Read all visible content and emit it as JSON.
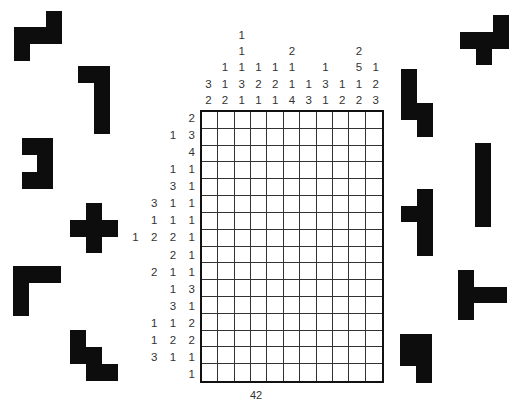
{
  "puzzle": {
    "type": "nonogram",
    "columns": 11,
    "rows": 16,
    "column_clues": [
      [
        3,
        2
      ],
      [
        1,
        1,
        2
      ],
      [
        1,
        1,
        1,
        3,
        1
      ],
      [
        1,
        2,
        1
      ],
      [
        1,
        2,
        1
      ],
      [
        2,
        1,
        1,
        4
      ],
      [
        1,
        3
      ],
      [
        1,
        3,
        1
      ],
      [
        1,
        2
      ],
      [
        2,
        5,
        1,
        2
      ],
      [
        1,
        2,
        3
      ]
    ],
    "row_clues": [
      [
        2
      ],
      [
        1,
        3
      ],
      [
        4
      ],
      [
        1,
        1
      ],
      [
        3,
        1
      ],
      [
        3,
        1,
        1
      ],
      [
        1,
        1,
        1
      ],
      [
        1,
        2,
        2,
        1
      ],
      [
        2,
        1
      ],
      [
        2,
        1,
        1
      ],
      [
        1,
        3
      ],
      [
        3,
        1
      ],
      [
        1,
        1,
        2
      ],
      [
        1,
        2,
        2
      ],
      [
        3,
        1,
        1
      ],
      [
        1
      ]
    ]
  },
  "pieces": [
    {
      "name": "z-piece",
      "rects": [
        [
          46,
          11,
          16,
          17
        ],
        [
          14,
          27,
          48,
          17
        ],
        [
          14,
          44,
          16,
          17
        ]
      ]
    },
    {
      "name": "l-hook-piece",
      "rects": [
        [
          78,
          66,
          32,
          17
        ],
        [
          94,
          66,
          16,
          68
        ]
      ]
    },
    {
      "name": "c-piece",
      "rects": [
        [
          22,
          138,
          31,
          17
        ],
        [
          37,
          155,
          16,
          17
        ],
        [
          22,
          172,
          31,
          17
        ]
      ]
    },
    {
      "name": "plus-piece",
      "rects": [
        [
          86,
          203,
          16,
          50
        ],
        [
          70,
          220,
          48,
          17
        ]
      ]
    },
    {
      "name": "corner-piece",
      "rects": [
        [
          13,
          266,
          48,
          17
        ],
        [
          13,
          266,
          16,
          50
        ]
      ]
    },
    {
      "name": "stair-piece",
      "rects": [
        [
          70,
          330,
          16,
          34
        ],
        [
          86,
          347,
          16,
          34
        ],
        [
          102,
          364,
          16,
          17
        ]
      ]
    },
    {
      "name": "t-top-right-piece",
      "rects": [
        [
          493,
          15,
          16,
          17
        ],
        [
          460,
          32,
          49,
          17
        ],
        [
          476,
          49,
          16,
          16
        ]
      ]
    },
    {
      "name": "step-piece",
      "rects": [
        [
          401,
          69,
          16,
          51
        ],
        [
          417,
          103,
          16,
          34
        ]
      ]
    },
    {
      "name": "bar-piece",
      "rects": [
        [
          475,
          143,
          16,
          84
        ]
      ]
    },
    {
      "name": "t-left-piece",
      "rects": [
        [
          417,
          189,
          16,
          67
        ],
        [
          401,
          206,
          16,
          16
        ]
      ]
    },
    {
      "name": "t-right-piece",
      "rects": [
        [
          458,
          270,
          16,
          50
        ],
        [
          474,
          287,
          33,
          16
        ]
      ]
    },
    {
      "name": "p-piece",
      "rects": [
        [
          400,
          334,
          32,
          32
        ],
        [
          416,
          366,
          16,
          17
        ]
      ]
    }
  ],
  "page_number": "42"
}
